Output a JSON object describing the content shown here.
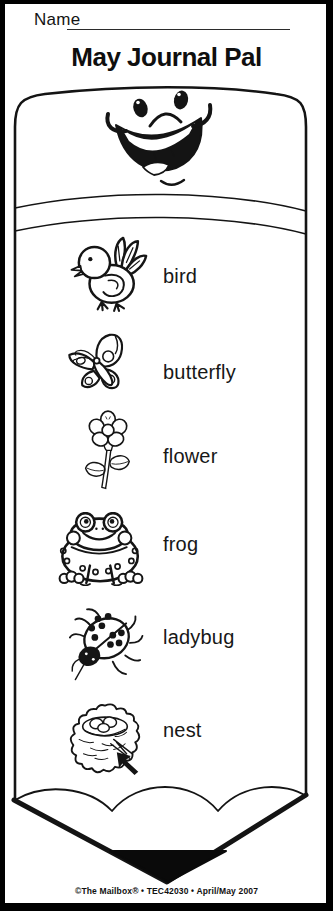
{
  "header": {
    "name_label": "Name",
    "title": "May Journal Pal"
  },
  "pencil": {
    "face_icon": "smiley-face",
    "items": [
      {
        "icon": "bird-icon",
        "label": "bird"
      },
      {
        "icon": "butterfly-icon",
        "label": "butterfly"
      },
      {
        "icon": "flower-icon",
        "label": "flower"
      },
      {
        "icon": "frog-icon",
        "label": "frog"
      },
      {
        "icon": "ladybug-icon",
        "label": "ladybug"
      },
      {
        "icon": "nest-icon",
        "label": "nest"
      }
    ],
    "annotation_icon": "up-left-arrow"
  },
  "footer": {
    "credit": "©The Mailbox® • TEC42030 • April/May 2007"
  },
  "colors": {
    "ink": "#141414",
    "paper": "#ffffff",
    "frame": "#000000"
  }
}
